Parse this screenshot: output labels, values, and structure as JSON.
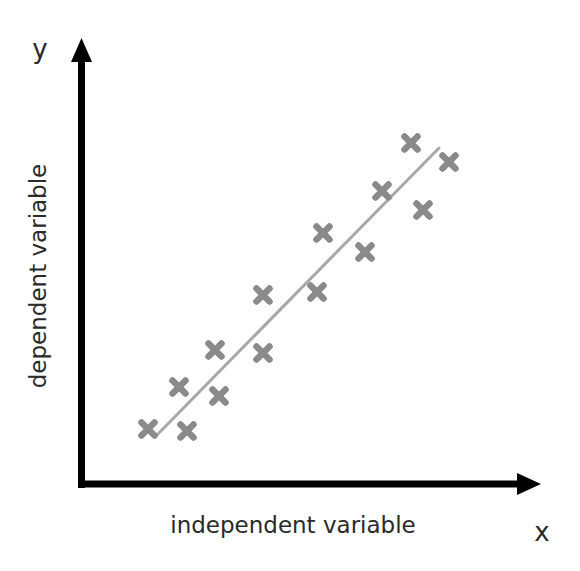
{
  "chart_data": {
    "type": "scatter",
    "title": "",
    "xlabel": "independent variable",
    "ylabel": "dependent variable",
    "x_axis_letter": "x",
    "y_axis_letter": "y",
    "grid": false,
    "legend": null,
    "ticks": false,
    "points_px": [
      {
        "x": 148,
        "y": 429
      },
      {
        "x": 179,
        "y": 387
      },
      {
        "x": 187,
        "y": 431
      },
      {
        "x": 215,
        "y": 350
      },
      {
        "x": 219,
        "y": 396
      },
      {
        "x": 263,
        "y": 295
      },
      {
        "x": 263,
        "y": 353
      },
      {
        "x": 317,
        "y": 292
      },
      {
        "x": 323,
        "y": 233
      },
      {
        "x": 365,
        "y": 252
      },
      {
        "x": 382,
        "y": 191
      },
      {
        "x": 411,
        "y": 143
      },
      {
        "x": 423,
        "y": 210
      },
      {
        "x": 449,
        "y": 162
      }
    ],
    "trend_line_px": {
      "x1": 155,
      "y1": 437,
      "x2": 439,
      "y2": 148
    },
    "marker": "x",
    "colors": {
      "axis": "#000000",
      "marker": "#8a8a8a",
      "trend_line": "#a8a8a8",
      "text": "#2a2a2a"
    }
  }
}
